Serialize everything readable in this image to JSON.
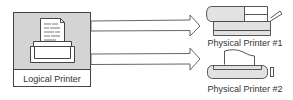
{
  "diagram": {
    "source": {
      "label": "Logical Printer",
      "icon": "printer-with-document-icon"
    },
    "targets": [
      {
        "label": "Physical Printer #1",
        "icon": "laser-printer-icon"
      },
      {
        "label": "Physical Printer #2",
        "icon": "dot-matrix-printer-icon"
      }
    ],
    "connections": [
      {
        "from": "Logical Printer",
        "to": "Physical Printer #1",
        "style": "hollow-arrow"
      },
      {
        "from": "Logical Printer",
        "to": "Physical Printer #2",
        "style": "hollow-arrow"
      }
    ],
    "colors": {
      "box_fill": "#d4d4d4",
      "stroke": "#444444",
      "device_fill": "#e2e2e2"
    }
  }
}
